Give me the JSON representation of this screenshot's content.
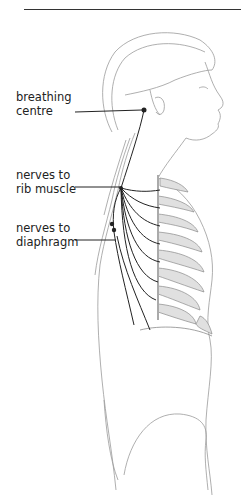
{
  "diagram": {
    "type": "anatomical line illustration",
    "labels": [
      {
        "line1": "breathing",
        "line2": "centre"
      },
      {
        "line1": "nerves to",
        "line2": "rib muscle"
      },
      {
        "line1": "nerves to",
        "line2": "diaphragm"
      }
    ],
    "colors": {
      "line": "#222222",
      "sketch": "#8a8a8a",
      "rib_shade": "#d8d8d8"
    }
  }
}
